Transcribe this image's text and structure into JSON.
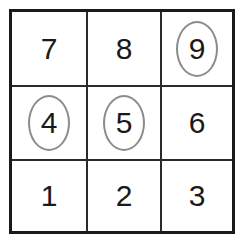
{
  "grid": {
    "rows": 3,
    "cols": 3,
    "cells": [
      {
        "label": "7",
        "circled": false
      },
      {
        "label": "8",
        "circled": false
      },
      {
        "label": "9",
        "circled": true
      },
      {
        "label": "4",
        "circled": true
      },
      {
        "label": "5",
        "circled": true
      },
      {
        "label": "6",
        "circled": false
      },
      {
        "label": "1",
        "circled": false
      },
      {
        "label": "2",
        "circled": false
      },
      {
        "label": "3",
        "circled": false
      }
    ],
    "circle_color": "#8c8c8c",
    "line_color": "#1a1a1a"
  }
}
